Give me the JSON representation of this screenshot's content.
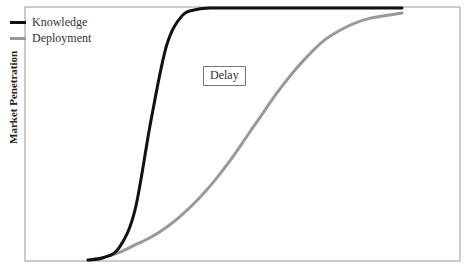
{
  "chart_data": {
    "type": "line",
    "title": "",
    "xlabel": "",
    "ylabel": "Market Penetration",
    "grid": false,
    "legend_position": "top-left",
    "annotations": [
      "Delay"
    ],
    "x": [
      0,
      5,
      10,
      15,
      20,
      25,
      30,
      35,
      40,
      45,
      50,
      55,
      60,
      65,
      70,
      75,
      80,
      85,
      90,
      95,
      100
    ],
    "series": [
      {
        "name": "Knowledge",
        "color": "#111111",
        "values": [
          0,
          1,
          5,
          20,
          55,
          85,
          97,
          99.5,
          100,
          100,
          100,
          100,
          100,
          100,
          100,
          100,
          100,
          100,
          100,
          100,
          100
        ]
      },
      {
        "name": "Deployment",
        "color": "#999999",
        "values": [
          0,
          1,
          3,
          6,
          9,
          13,
          18,
          24,
          31,
          39,
          48,
          57,
          66,
          74,
          81,
          87,
          91,
          94,
          96,
          97,
          98
        ]
      }
    ],
    "ylim": [
      0,
      100
    ]
  },
  "legend": {
    "items": [
      {
        "label": "Knowledge",
        "color": "#111111"
      },
      {
        "label": "Deployment",
        "color": "#999999"
      }
    ]
  },
  "annotation": {
    "delay_label": "Delay"
  },
  "axis": {
    "ylabel": "Market Penetration"
  }
}
